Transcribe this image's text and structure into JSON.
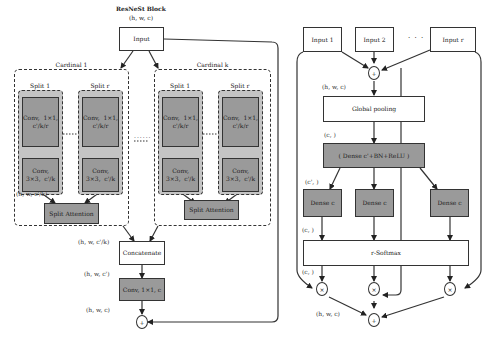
{
  "left": {
    "title": "ResNeSt Block",
    "input_dims": "(h,  w,  c)",
    "input_label": "Input",
    "cardinals": [
      {
        "label": "Cardinal 1",
        "splits": [
          {
            "label": "Split 1",
            "conv1": "Conv,  1×1,\nc'/k/r",
            "conv3": "Conv,\n3×3,  c'/k"
          },
          {
            "label": "Split r",
            "conv1": "Conv,  1×1,\nc'/k/r",
            "conv3": "Conv,\n3×3,  c'/k"
          }
        ],
        "split_dims": "(h,  w,  c'/k)",
        "attention": "Split Attention"
      },
      {
        "label": "Cardinal k",
        "splits": [
          {
            "label": "Split 1",
            "conv1": "Conv,  1×1,\nc'/k/r",
            "conv3": "Conv,\n3×3,  c'/k"
          },
          {
            "label": "Split r",
            "conv1": "Conv,  1×1,\nc'/k/r",
            "conv3": "Conv,\n3×3,  c'/k"
          }
        ],
        "attention": "Split Attention"
      }
    ],
    "concat_in_dims": "(h,  w,  c'/k)",
    "concat": "Concatenate",
    "concat_out_dims": "(h,  w,  c')",
    "final_conv": "Conv,  1×1,  c",
    "out_dims": "(h,  w,  c)",
    "sum_symbol": "+",
    "ellipsis": "......"
  },
  "right": {
    "inputs": [
      "Input 1",
      "Input 2",
      "Input r"
    ],
    "ellipsis": "· · ·",
    "sum_symbol": "+",
    "sum_dims": "(h,  w,  c)",
    "global_pooling": "Global pooling",
    "pool_dims": "(c,  )",
    "dense_main": "( Dense c'+BN+ReLU )",
    "dense_dims": "(c',  )",
    "dense_branches": [
      "Dense c",
      "Dense c",
      "Dense c"
    ],
    "branch_dims": "(c,  )",
    "softmax": "r-Softmax",
    "softmax_dims": "(c,  )",
    "mult_symbol": "×",
    "out_dims": "(h,  w,  c)"
  }
}
